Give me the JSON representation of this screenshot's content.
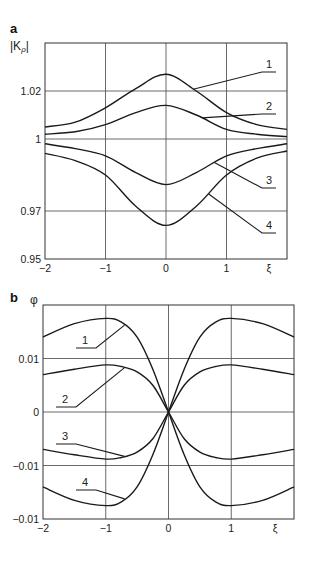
{
  "chart_data": [
    {
      "type": "line",
      "panel": "a",
      "title": "",
      "xlabel": "ξ",
      "ylabel": "|K_ρ|",
      "xlim": [
        -2,
        2
      ],
      "ylim": [
        0.95,
        1.04
      ],
      "grid": true,
      "x_ticks": [
        -2,
        -1,
        0,
        1
      ],
      "x_tick_labels": [
        "−2",
        "−1",
        "0",
        "1"
      ],
      "y_ticks": [
        0.95,
        0.97,
        1,
        1.02
      ],
      "y_tick_labels": [
        "0.95",
        "0.97",
        "1",
        "1.02"
      ],
      "x": [
        -2,
        -1.5,
        -1,
        -0.5,
        0,
        0.5,
        1,
        1.5,
        2
      ],
      "series": [
        {
          "name": "1",
          "values": [
            1.005,
            1.007,
            1.013,
            1.021,
            1.027,
            1.02,
            1.011,
            1.006,
            1.004
          ]
        },
        {
          "name": "2",
          "values": [
            1.002,
            1.003,
            1.006,
            1.011,
            1.014,
            1.01,
            1.004,
            1.002,
            1.001
          ]
        },
        {
          "name": "3",
          "values": [
            0.998,
            0.996,
            0.993,
            0.986,
            0.981,
            0.986,
            0.993,
            0.996,
            0.998
          ]
        },
        {
          "name": "4",
          "values": [
            0.994,
            0.991,
            0.985,
            0.972,
            0.964,
            0.972,
            0.985,
            0.992,
            0.995
          ]
        }
      ],
      "legend_labels": [
        {
          "name": "1",
          "anchor_x": 0.45,
          "series": "1"
        },
        {
          "name": "2",
          "anchor_x": 0.6,
          "series": "2"
        },
        {
          "name": "3",
          "anchor_x": 0.8,
          "series": "3"
        },
        {
          "name": "4",
          "anchor_x": 0.7,
          "series": "4"
        }
      ]
    },
    {
      "type": "line",
      "panel": "b",
      "title": "",
      "xlabel": "ξ",
      "ylabel": "φ",
      "xlim": [
        -2,
        2
      ],
      "ylim": [
        -0.02,
        0.02
      ],
      "grid": true,
      "x_ticks": [
        -2,
        -1,
        0,
        1
      ],
      "x_tick_labels": [
        "−2",
        "−1",
        "0",
        "1"
      ],
      "y_ticks": [
        -0.02,
        -0.01,
        0,
        0.01
      ],
      "y_tick_labels": [
        "−0.01",
        "−0.01",
        "0",
        "0.01"
      ],
      "x": [
        -2,
        -1.5,
        -1,
        -0.75,
        -0.5,
        -0.25,
        0,
        0.25,
        0.5,
        0.75,
        1,
        1.5,
        2
      ],
      "series": [
        {
          "name": "1",
          "values": [
            0.014,
            0.0165,
            0.0175,
            0.0168,
            0.014,
            0.008,
            0,
            -0.008,
            -0.014,
            -0.0168,
            -0.0175,
            -0.0165,
            -0.014
          ]
        },
        {
          "name": "2",
          "values": [
            0.007,
            0.008,
            0.0088,
            0.0085,
            0.0075,
            0.005,
            0,
            -0.005,
            -0.0075,
            -0.0085,
            -0.0088,
            -0.008,
            -0.007
          ]
        },
        {
          "name": "3",
          "values": [
            -0.007,
            -0.008,
            -0.0088,
            -0.0085,
            -0.0075,
            -0.005,
            0,
            0.005,
            0.0075,
            0.0085,
            0.0088,
            0.008,
            0.007
          ]
        },
        {
          "name": "4",
          "values": [
            -0.014,
            -0.0165,
            -0.0175,
            -0.0168,
            -0.014,
            -0.008,
            0,
            0.008,
            0.014,
            0.0168,
            0.0175,
            0.0165,
            0.014
          ]
        }
      ],
      "legend_labels": [
        {
          "name": "1",
          "anchor_x": -0.7,
          "series": "1"
        },
        {
          "name": "2",
          "anchor_x": -0.7,
          "series": "2"
        },
        {
          "name": "3",
          "anchor_x": -0.7,
          "series": "3"
        },
        {
          "name": "4",
          "anchor_x": -0.7,
          "series": "4"
        }
      ]
    }
  ],
  "labels": {
    "panel_a": "a",
    "panel_b": "b",
    "a_ylabel": "|K",
    "a_ylabel_sub": "ρ",
    "a_ylabel_end": "|",
    "b_ylabel": "φ",
    "xi": "ξ"
  }
}
